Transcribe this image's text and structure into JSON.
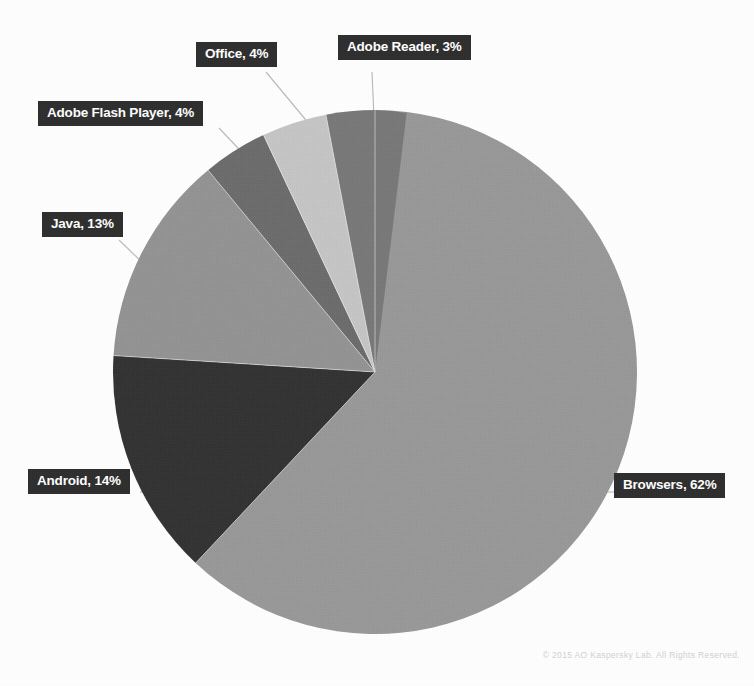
{
  "chart_data": {
    "type": "pie",
    "title": "",
    "subtitle": "",
    "legend_position": "callout-labels",
    "grid": false,
    "categories": [
      "Browsers",
      "Android",
      "Java",
      "Adobe Flash Player",
      "Office",
      "Adobe Reader"
    ],
    "values": [
      62,
      14,
      13,
      4,
      4,
      3
    ],
    "unit": "%",
    "labels": [
      "Browsers, 62%",
      "Android, 14%",
      "Java, 13%",
      "Adobe Flash Player, 4%",
      "Office, 4%",
      "Adobe Reader, 3%"
    ],
    "slice_colors": [
      "#9b9b9b",
      "#343434",
      "#969696",
      "#6e6e6e",
      "#c9c9c9",
      "#7b7b7b"
    ],
    "annotations": []
  },
  "callouts": {
    "browsers": "Browsers, 62%",
    "android": "Android, 14%",
    "java": "Java, 13%",
    "flash": "Adobe Flash Player, 4%",
    "office": "Office, 4%",
    "adobe_reader": "Adobe Reader, 3%"
  },
  "footer": {
    "copyright": "© 2015 AO Kaspersky Lab. All Rights Reserved."
  },
  "colors": {
    "background": "#ffffff",
    "callout_background": "#2e2e2e",
    "callout_text": "#ffffff",
    "leader_line": "#bdbdbd",
    "footer_text": "#d2d2d2"
  }
}
